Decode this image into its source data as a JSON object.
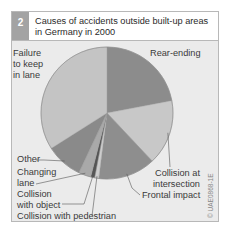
{
  "figure": {
    "number": "2",
    "title": "Causes of accidents outside built-up areas in Germany in 2000",
    "credit": "© UAE0868-1E"
  },
  "chart_data": {
    "type": "pie",
    "title": "Causes of accidents outside built-up areas in Germany in 2000",
    "unit": "percent (estimated from slice angles)",
    "start_angle": "12 o'clock, clockwise",
    "slices": [
      {
        "label": "Rear-ending",
        "value": 22,
        "color": "#8c8c8c"
      },
      {
        "label": "Collision at intersection",
        "value": 16,
        "color": "#c8c8c8"
      },
      {
        "label": "Frontal impact",
        "value": 14,
        "color": "#8e8e8e"
      },
      {
        "label": "Collision with pedestrian",
        "value": 1,
        "color": "#cdcdcd"
      },
      {
        "label": "Collision with object",
        "value": 1,
        "color": "#555555"
      },
      {
        "label": "Changing lane",
        "value": 3,
        "color": "#a9a9a9"
      },
      {
        "label": "Other",
        "value": 9,
        "color": "#8a8a8a"
      },
      {
        "label": "Failure to keep in lane",
        "value": 34,
        "color": "#c4c4c4"
      }
    ],
    "labels": {
      "rear": [
        "Rear-ending"
      ],
      "intersection": [
        "Collision at",
        "intersection"
      ],
      "frontal": [
        "Frontal impact"
      ],
      "pedestrian": [
        "Collision with pedestrian"
      ],
      "object": [
        "Collision",
        "with object"
      ],
      "changing": [
        "Changing",
        "lane"
      ],
      "other": [
        "Other"
      ],
      "failure": [
        "Failure",
        "to keep",
        "in lane"
      ]
    }
  }
}
